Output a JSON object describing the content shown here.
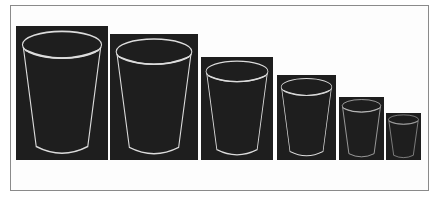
{
  "figure": {
    "colors": {
      "panel_background": "#1e1e1e",
      "edge_stroke": "#dcdcdc",
      "frame_border": "#8a8a8a",
      "page_background": "#ffffff"
    },
    "panels": [
      {
        "id": 1,
        "label": "cup-1",
        "x": 16,
        "y": 26,
        "w": 92,
        "h": 134
      },
      {
        "id": 2,
        "label": "cup-2",
        "x": 110,
        "y": 34,
        "w": 88,
        "h": 126
      },
      {
        "id": 3,
        "label": "cup-3",
        "x": 201,
        "y": 57,
        "w": 72,
        "h": 103
      },
      {
        "id": 4,
        "label": "cup-4",
        "x": 277,
        "y": 75,
        "w": 59,
        "h": 85
      },
      {
        "id": 5,
        "label": "cup-5",
        "x": 339,
        "y": 97,
        "w": 45,
        "h": 63
      },
      {
        "id": 6,
        "label": "cup-6",
        "x": 386,
        "y": 113,
        "w": 35,
        "h": 47
      }
    ]
  }
}
